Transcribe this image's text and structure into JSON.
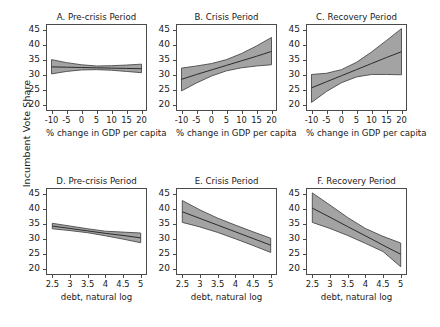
{
  "figure": {
    "ylabel": "Incumbent Vote Share",
    "caption": ""
  },
  "axes": {
    "y_ticks": [
      "20",
      "25",
      "30",
      "35",
      "40",
      "45"
    ],
    "y_values": [
      20,
      25,
      30,
      35,
      40,
      45
    ],
    "ylim": [
      18.5,
      46.5
    ],
    "gdp_ticks": [
      "-10",
      "-5",
      "0",
      "5",
      "10",
      "15",
      "20"
    ],
    "gdp_values": [
      -10,
      -5,
      0,
      5,
      10,
      15,
      20
    ],
    "gdp_lim": [
      -11.5,
      21.5
    ],
    "gdp_label": "% change in GDP per capita",
    "debt_ticks": [
      "2.5",
      "3",
      "3.5",
      "4",
      "4.5",
      "5"
    ],
    "debt_values": [
      2.5,
      3,
      3.5,
      4,
      4.5,
      5
    ],
    "debt_lim": [
      2.35,
      5.15
    ],
    "debt_label": "debt, natural log"
  },
  "style": {
    "band_fill": "#a3a3a3",
    "band_edge": "#4a4a4a",
    "line_color": "#2b2b2b",
    "frame_color": "#4a4a4a"
  },
  "chart_data": {
    "type": "line",
    "ylabel": "Incumbent Vote Share",
    "ylim": [
      18.5,
      46.5
    ],
    "grid": false,
    "legend": "none",
    "layout": "2 rows x 3 columns of panels, shared y-axis",
    "panels": [
      {
        "id": "A",
        "title": "A. Pre-crisis Period",
        "xlabel": "% change in GDP per capita",
        "xlim": [
          -11.5,
          21.5
        ],
        "x": [
          -10,
          -5,
          0,
          5,
          10,
          15,
          20
        ],
        "fit": [
          32.7,
          32.6,
          32.5,
          32.4,
          32.3,
          32.2,
          32.1
        ],
        "ci_lower": [
          30.4,
          31.2,
          31.7,
          31.8,
          31.6,
          31.2,
          30.8
        ],
        "ci_upper": [
          35.1,
          34.1,
          33.4,
          33.0,
          33.1,
          33.3,
          33.6
        ]
      },
      {
        "id": "B",
        "title": "B. Crisis Period",
        "xlabel": "% change in GDP per capita",
        "xlim": [
          -11.5,
          21.5
        ],
        "x": [
          -10,
          -5,
          0,
          5,
          10,
          15,
          20
        ],
        "fit": [
          28.6,
          30.2,
          31.7,
          33.2,
          34.7,
          36.2,
          37.8
        ],
        "ci_lower": [
          24.8,
          27.4,
          29.7,
          31.4,
          32.4,
          33.0,
          33.4
        ],
        "ci_upper": [
          32.3,
          33.0,
          33.8,
          35.1,
          37.1,
          39.6,
          42.4
        ]
      },
      {
        "id": "C",
        "title": "C. Recovery Period",
        "xlabel": "% change in GDP per capita",
        "xlim": [
          -11.5,
          21.5
        ],
        "x": [
          -10,
          -5,
          0,
          5,
          10,
          15,
          20
        ],
        "fit": [
          25.8,
          27.8,
          29.8,
          31.8,
          33.8,
          35.8,
          37.7
        ],
        "ci_lower": [
          21.0,
          24.6,
          27.5,
          29.4,
          30.2,
          30.2,
          30.1
        ],
        "ci_upper": [
          30.2,
          30.6,
          31.8,
          34.2,
          37.6,
          41.4,
          45.3
        ]
      },
      {
        "id": "D",
        "title": "D. Pre-crisis Period",
        "xlabel": "debt, natural log",
        "xlim": [
          2.35,
          5.15
        ],
        "x": [
          2.5,
          3.0,
          3.5,
          4.0,
          4.5,
          5.0
        ],
        "fit": [
          34.3,
          33.5,
          32.7,
          31.9,
          31.2,
          30.4
        ],
        "ci_lower": [
          33.4,
          32.8,
          32.1,
          31.1,
          30.0,
          28.8
        ],
        "ci_upper": [
          35.2,
          34.3,
          33.4,
          32.6,
          32.3,
          32.0
        ]
      },
      {
        "id": "E",
        "title": "E. Crisis Period",
        "xlabel": "debt, natural log",
        "xlim": [
          2.35,
          5.15
        ],
        "x": [
          2.5,
          3.0,
          3.5,
          4.0,
          4.5,
          5.0
        ],
        "fit": [
          39.0,
          36.8,
          34.6,
          32.4,
          30.2,
          28.0
        ],
        "ci_lower": [
          35.5,
          34.0,
          32.2,
          30.1,
          27.9,
          25.6
        ],
        "ci_upper": [
          42.7,
          39.6,
          36.9,
          34.6,
          32.4,
          30.3
        ]
      },
      {
        "id": "F",
        "title": "F. Recovery Period",
        "xlabel": "debt, natural log",
        "xlim": [
          2.35,
          5.15
        ],
        "x": [
          2.5,
          3.0,
          3.5,
          4.0,
          4.5,
          5.0
        ],
        "fit": [
          40.2,
          37.2,
          34.1,
          31.1,
          28.0,
          25.0
        ],
        "ci_lower": [
          35.5,
          33.5,
          31.2,
          28.6,
          25.9,
          20.9
        ],
        "ci_upper": [
          45.2,
          41.2,
          37.1,
          33.5,
          30.9,
          28.7
        ]
      }
    ]
  }
}
